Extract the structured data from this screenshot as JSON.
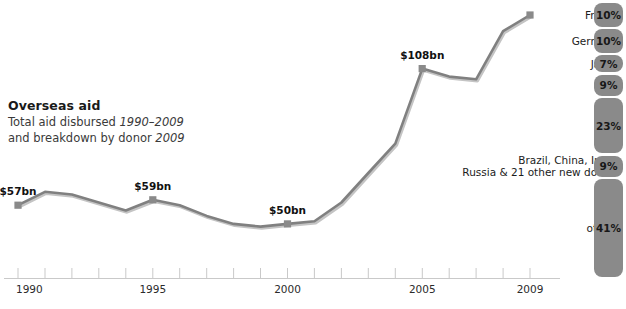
{
  "caption": {
    "heading": "Overseas aid",
    "line1_a": "Total aid disbursed ",
    "line1_b": "1990–2009",
    "line2_a": "and breakdown by donor ",
    "line2_b": "2009"
  },
  "axis": {
    "tick_labels": [
      "1990",
      "1995",
      "2000",
      "2005",
      "2009"
    ],
    "tick_years": [
      1990,
      1995,
      2000,
      2005,
      2009
    ]
  },
  "colors": {
    "line": "#808080",
    "marker": "#8a8a8a",
    "bar": "#8a8a8a",
    "axis": "#c9c9c9",
    "text": "#1a1a1a"
  },
  "chart_data": {
    "type": "line",
    "title": "Overseas aid",
    "subtitle": "Total aid disbursed 1990–2009 and breakdown by donor 2009",
    "xlabel": "",
    "ylabel": "Total aid disbursed (US$bn)",
    "x": [
      1990,
      1991,
      1992,
      1993,
      1994,
      1995,
      1996,
      1997,
      1998,
      1999,
      2000,
      2001,
      2002,
      2003,
      2004,
      2005,
      2006,
      2007,
      2008,
      2009
    ],
    "values": [
      57,
      62,
      61,
      58,
      55,
      59,
      57,
      53,
      50,
      49,
      50,
      51,
      58,
      69,
      80,
      108,
      105,
      104,
      122,
      128
    ],
    "point_labels": [
      {
        "year": 1990,
        "label": "$57bn"
      },
      {
        "year": 1995,
        "label": "$59bn"
      },
      {
        "year": 2000,
        "label": "$50bn"
      },
      {
        "year": 2005,
        "label": "$108bn"
      }
    ],
    "grid": false,
    "legend": "none",
    "ylim": [
      40,
      135
    ],
    "xlim": [
      1990,
      2009
    ]
  },
  "donors": {
    "type": "bar",
    "title": "breakdown by donor 2009",
    "unit": "percent of total aid",
    "items": [
      {
        "name": "France",
        "pct": 10,
        "pct_label": "10%"
      },
      {
        "name": "Germany",
        "pct": 10,
        "pct_label": "10%"
      },
      {
        "name": "Japan",
        "pct": 7,
        "pct_label": "7%"
      },
      {
        "name": "UK",
        "pct": 9,
        "pct_label": "9%"
      },
      {
        "name": "USA",
        "pct": 23,
        "pct_label": "23%"
      },
      {
        "name": "Brazil, China, India,\nRussia & 21 other new donors",
        "pct": 9,
        "pct_label": "9%"
      },
      {
        "name": "others",
        "pct": 41,
        "pct_label": "41%"
      }
    ]
  }
}
